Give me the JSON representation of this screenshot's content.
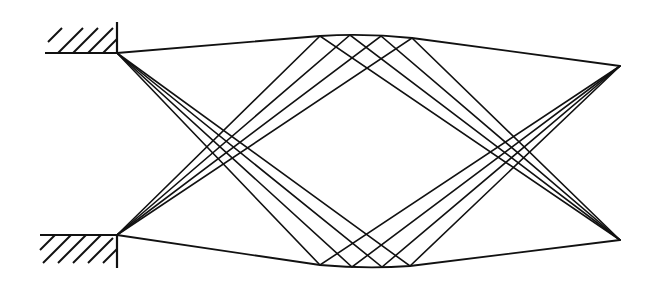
{
  "diagram": {
    "type": "ray-optics",
    "colors": {
      "line": "#111111",
      "background": "#ffffff"
    },
    "sources": [
      {
        "name": "top-source",
        "x": 117,
        "y": 53
      },
      {
        "name": "bottom-source",
        "x": 117,
        "y": 235
      }
    ],
    "focal_points": [
      {
        "name": "upper-right-focus",
        "x": 620,
        "y": 66
      },
      {
        "name": "lower-right-focus",
        "x": 620,
        "y": 240
      }
    ],
    "top_mirror_points": [
      [
        320,
        36
      ],
      [
        350,
        35
      ],
      [
        381,
        36
      ],
      [
        412,
        38
      ]
    ],
    "bottom_mirror_points": [
      [
        320,
        265
      ],
      [
        352,
        267
      ],
      [
        382,
        267
      ],
      [
        410,
        266
      ]
    ],
    "walls": [
      {
        "name": "top-wall",
        "x1": 45,
        "x2": 117,
        "y": 53,
        "vertical_top": 20
      },
      {
        "name": "bottom-wall",
        "x1": 40,
        "x2": 117,
        "y": 235,
        "vertical_bottom": 268
      }
    ]
  }
}
